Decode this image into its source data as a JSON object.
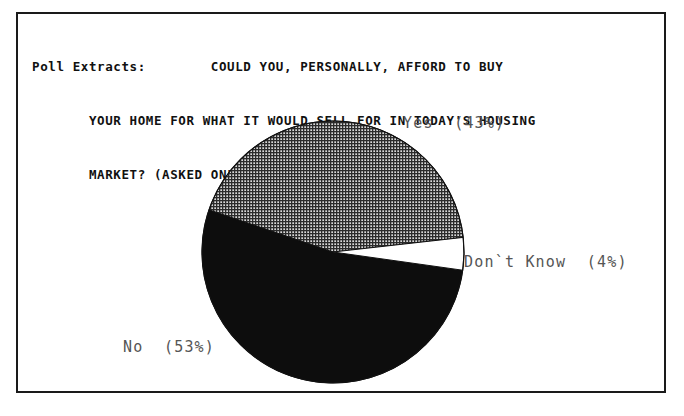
{
  "frame": {
    "border_color": "#1a1a1a"
  },
  "title": {
    "prefix": "Poll Extracts:",
    "lines": [
      "Poll Extracts:        COULD YOU, PERSONALLY, AFFORD TO BUY",
      "       YOUR HOME FOR WHAT IT WOULD SELL FOR IN TODAY'S HOUSING",
      "       MARKET? (ASKED ONLY OF HOME OWNERS.)"
    ]
  },
  "labels": {
    "yes": "Yes  (43%)",
    "dont_know": "Don`t Know  (4%)",
    "no": "No  (53%)"
  },
  "colors": {
    "black_slice": "#0d0d0d",
    "white_slice": "#ffffff",
    "hatch_dark": "#2b2b2b",
    "hatch_light": "#d8d8d8",
    "outline": "#111111",
    "label_text": "#555555",
    "title_text": "#111111"
  },
  "chart_data": {
    "type": "pie",
    "title": "Poll Extracts: COULD YOU, PERSONALLY, AFFORD TO BUY YOUR HOME FOR WHAT IT WOULD SELL FOR IN TODAY'S HOUSING MARKET? (ASKED ONLY OF HOME OWNERS.)",
    "subtitle": "",
    "xlabel": "",
    "ylabel": "",
    "categories": [
      "Yes",
      "No",
      "Don`t Know"
    ],
    "values": [
      43,
      53,
      4
    ],
    "units": "percent",
    "data_labels": [
      "Yes  (43%)",
      "No  (53%)",
      "Don`t Know  (4%)"
    ],
    "slice_fills": [
      "crosshatch-gray",
      "solid-black",
      "white"
    ],
    "legend_position": "outside-labels",
    "grid": false,
    "start_angle_deg": 0,
    "direction": "counterclockwise"
  },
  "geometry": {
    "center_x": 165,
    "center_y": 154,
    "radius": 131
  }
}
